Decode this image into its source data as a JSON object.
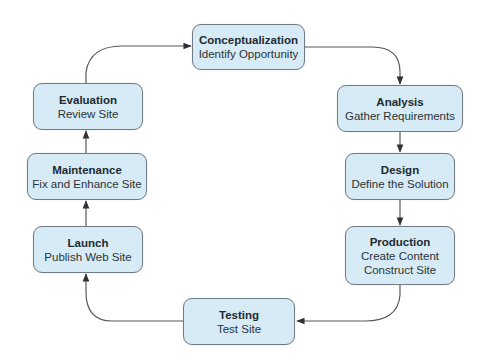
{
  "diagram": {
    "type": "cycle",
    "colors": {
      "node_fill": "#d6ebf5",
      "node_border": "#6f7a82",
      "connector": "#4a4f54",
      "text": "#222a30"
    },
    "nodes": [
      {
        "id": "conceptualization",
        "title": "Conceptualization",
        "lines": [
          "Identify Opportunity"
        ]
      },
      {
        "id": "analysis",
        "title": "Analysis",
        "lines": [
          "Gather Requirements"
        ]
      },
      {
        "id": "design",
        "title": "Design",
        "lines": [
          "Define the Solution"
        ]
      },
      {
        "id": "production",
        "title": "Production",
        "lines": [
          "Create Content",
          "Construct Site"
        ]
      },
      {
        "id": "testing",
        "title": "Testing",
        "lines": [
          "Test Site"
        ]
      },
      {
        "id": "launch",
        "title": "Launch",
        "lines": [
          "Publish Web Site"
        ]
      },
      {
        "id": "maintenance",
        "title": "Maintenance",
        "lines": [
          "Fix and Enhance Site"
        ]
      },
      {
        "id": "evaluation",
        "title": "Evaluation",
        "lines": [
          "Review Site"
        ]
      }
    ],
    "edges": [
      {
        "from": "conceptualization",
        "to": "analysis"
      },
      {
        "from": "analysis",
        "to": "design"
      },
      {
        "from": "design",
        "to": "production"
      },
      {
        "from": "production",
        "to": "testing"
      },
      {
        "from": "testing",
        "to": "launch"
      },
      {
        "from": "launch",
        "to": "maintenance"
      },
      {
        "from": "maintenance",
        "to": "evaluation"
      },
      {
        "from": "evaluation",
        "to": "conceptualization"
      }
    ]
  }
}
